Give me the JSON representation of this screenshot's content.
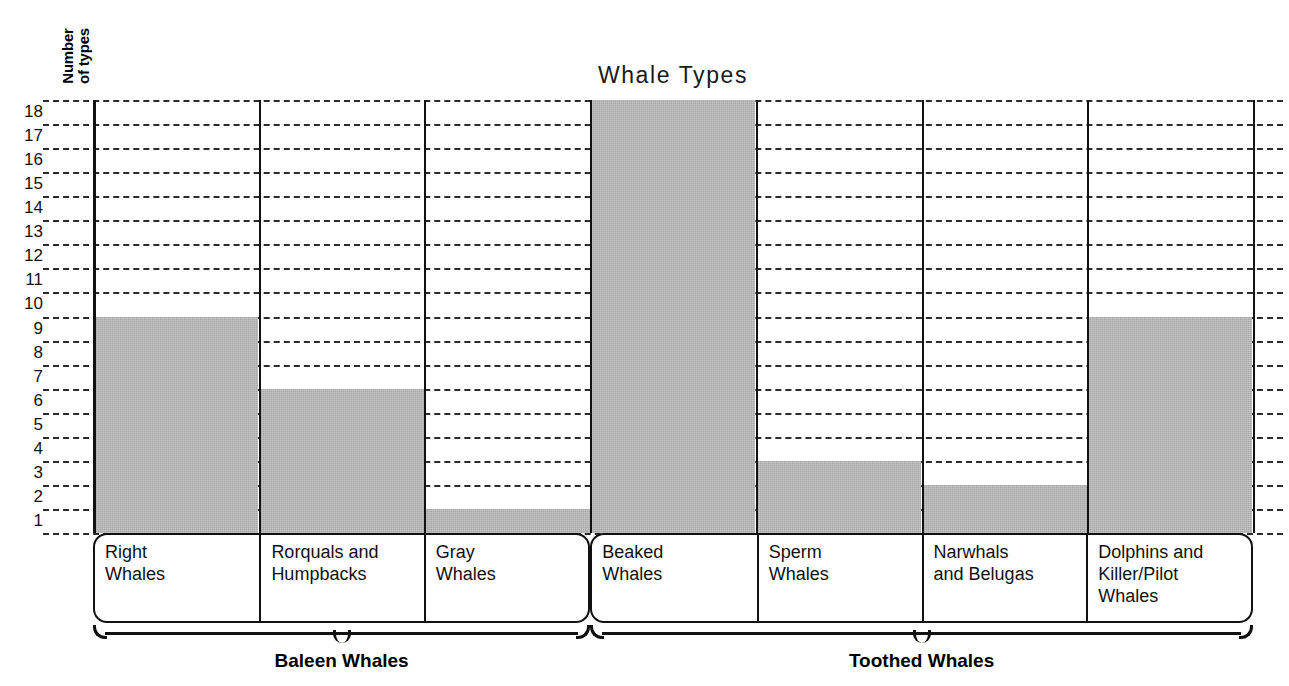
{
  "chart_data": {
    "type": "bar",
    "title": "Whale Types",
    "xlabel": "",
    "ylabel": "Number\nof types",
    "ylim": [
      0,
      18
    ],
    "ytick_labels": [
      "18",
      "17",
      "16",
      "15",
      "14",
      "13",
      "12",
      "11",
      "10",
      "9",
      "8",
      "7",
      "6",
      "5",
      "4",
      "3",
      "2",
      "1"
    ],
    "grid": true,
    "legend": "none",
    "categories": [
      "Right\nWhales",
      "Rorquals and\nHumpbacks",
      "Gray\nWhales",
      "Beaked\nWhales",
      "Sperm\nWhales",
      "Narwhals\nand Belugas",
      "Dolphins and\nKiller/Pilot\nWhales"
    ],
    "values": [
      9,
      6,
      1,
      18,
      3,
      2,
      9
    ],
    "bar_color": "#a9a9a9",
    "groups": [
      {
        "label": "Baleen Whales",
        "categories": [
          0,
          1,
          2
        ]
      },
      {
        "label": "Toothed Whales",
        "categories": [
          3,
          4,
          5,
          6
        ]
      }
    ]
  }
}
